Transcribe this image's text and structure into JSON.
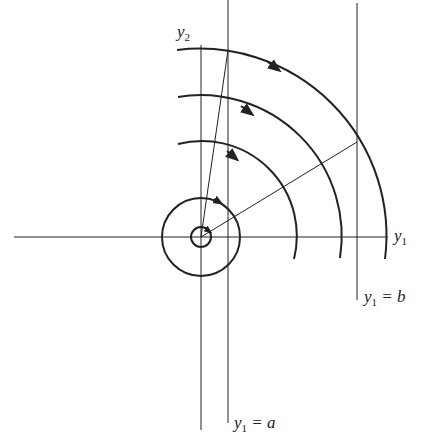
{
  "diagram": {
    "labels": {
      "y2_axis": {
        "var": "y",
        "sub": "2"
      },
      "y1_axis": {
        "var": "y",
        "sub": "1"
      },
      "line_b": {
        "var": "y",
        "sub": "1",
        "rest": " = b"
      },
      "line_a": {
        "var": "y",
        "sub": "1",
        "rest": " = a"
      }
    },
    "colors": {
      "stroke": "#222222",
      "background": "#ffffff"
    },
    "arcs": [
      {
        "name": "inner-arc",
        "radius": 92
      },
      {
        "name": "middle-arc",
        "radius": 138
      },
      {
        "name": "outer-arc",
        "radius": 184
      }
    ],
    "circles": [
      {
        "name": "small-circle",
        "radius": 10
      },
      {
        "name": "large-circle",
        "radius": 39
      }
    ]
  }
}
